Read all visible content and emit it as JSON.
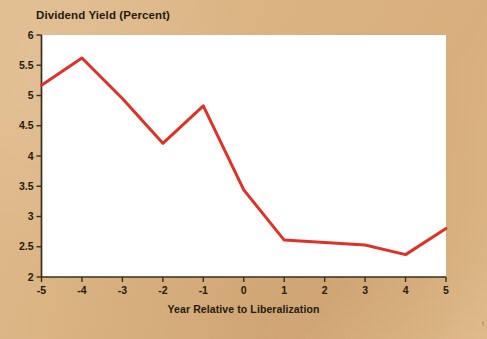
{
  "figure": {
    "background_color": "#dcb584",
    "plot_background_color": "#ffffff",
    "bottom_strip_color": "#2c1b41",
    "corner_mark": "("
  },
  "chart_data": {
    "type": "line",
    "title": "Dividend Yield (Percent)",
    "xlabel": "Year Relative to Liberalization",
    "ylabel": "",
    "x": [
      -5,
      -4,
      -3,
      -2,
      -1,
      0,
      1,
      2,
      3,
      4,
      5
    ],
    "values": [
      5.17,
      5.62,
      4.95,
      4.21,
      4.83,
      3.44,
      2.61,
      2.57,
      2.53,
      2.37,
      2.8
    ],
    "series": [
      {
        "name": "Dividend Yield",
        "color": "#e03127",
        "values": [
          5.17,
          5.62,
          4.95,
          4.21,
          4.83,
          3.44,
          2.61,
          2.57,
          2.53,
          2.37,
          2.8
        ]
      }
    ],
    "xlim": [
      -5,
      5
    ],
    "ylim": [
      2,
      6
    ],
    "xticks": [
      -5,
      -4,
      -3,
      -2,
      -1,
      0,
      1,
      2,
      3,
      4,
      5
    ],
    "xtick_labels": [
      "-5",
      "-4",
      "-3",
      "-2",
      "-1",
      "0",
      "1",
      "2",
      "3",
      "4",
      "5"
    ],
    "yticks": [
      2,
      2.5,
      3,
      3.5,
      4,
      4.5,
      5,
      5.5,
      6
    ],
    "ytick_labels": [
      "2",
      "2.5",
      "3",
      "3.5",
      "4",
      "4.5",
      "5",
      "5.5",
      "6"
    ],
    "grid": false,
    "legend": null,
    "line_width": 3
  }
}
